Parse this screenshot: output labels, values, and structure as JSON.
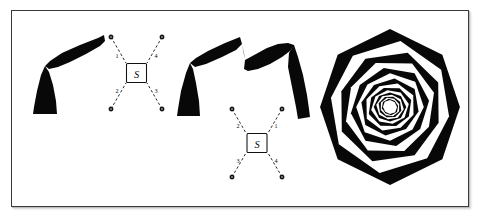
{
  "figure": {
    "background": "#ffffff",
    "ink_color": "#080808",
    "border_color": "#3a3a3a",
    "panels": [
      {
        "id": "panel-left",
        "name": "s-node-diagram-left",
        "center_label": "S",
        "spokes": [
          {
            "label": "1",
            "direction": "upper-left",
            "angle_deg": 135
          },
          {
            "label": "2",
            "direction": "lower-left",
            "angle_deg": 225
          },
          {
            "label": "3",
            "direction": "lower-right",
            "angle_deg": 315
          },
          {
            "label": "4",
            "direction": "upper-right",
            "angle_deg": 45
          }
        ],
        "shape_name": "black-wedge-arm"
      },
      {
        "id": "panel-middle",
        "name": "s-node-diagram-middle",
        "center_label": "S",
        "spokes": [
          {
            "label": "2",
            "direction": "upper-left",
            "angle_deg": 135
          },
          {
            "label": "3",
            "direction": "lower-left",
            "angle_deg": 225
          },
          {
            "label": "4",
            "direction": "lower-right",
            "angle_deg": 315
          },
          {
            "label": "1",
            "direction": "upper-right",
            "angle_deg": 45
          }
        ],
        "shape_name": "black-double-arm-arc"
      },
      {
        "id": "panel-right",
        "name": "nested-rotating-polygon-spiral",
        "rings": 16,
        "polygon_sides": 8,
        "rotation_step_deg": 9,
        "scale_step": 0.855,
        "fill_alternating": [
          "#080808",
          "#ffffff"
        ],
        "outer_radius": 74
      }
    ]
  },
  "chart_data": {
    "type": "diagram",
    "title": "",
    "panels": [
      {
        "panel": "left",
        "node_label": "S",
        "spoke_labels": [
          "1",
          "2",
          "3",
          "4"
        ],
        "spoke_label_positions": [
          "upper-left",
          "lower-left",
          "lower-right",
          "upper-right"
        ],
        "endpoint_count": 4
      },
      {
        "panel": "middle",
        "node_label": "S",
        "spoke_labels": [
          "2",
          "3",
          "4",
          "1"
        ],
        "spoke_label_positions": [
          "upper-left",
          "lower-left",
          "lower-right",
          "upper-right"
        ],
        "endpoint_count": 4
      },
      {
        "panel": "right",
        "ring_count": 16,
        "sides_per_ring": 8,
        "rotation_per_ring_deg": 9,
        "scale_per_ring": 0.855
      }
    ]
  }
}
